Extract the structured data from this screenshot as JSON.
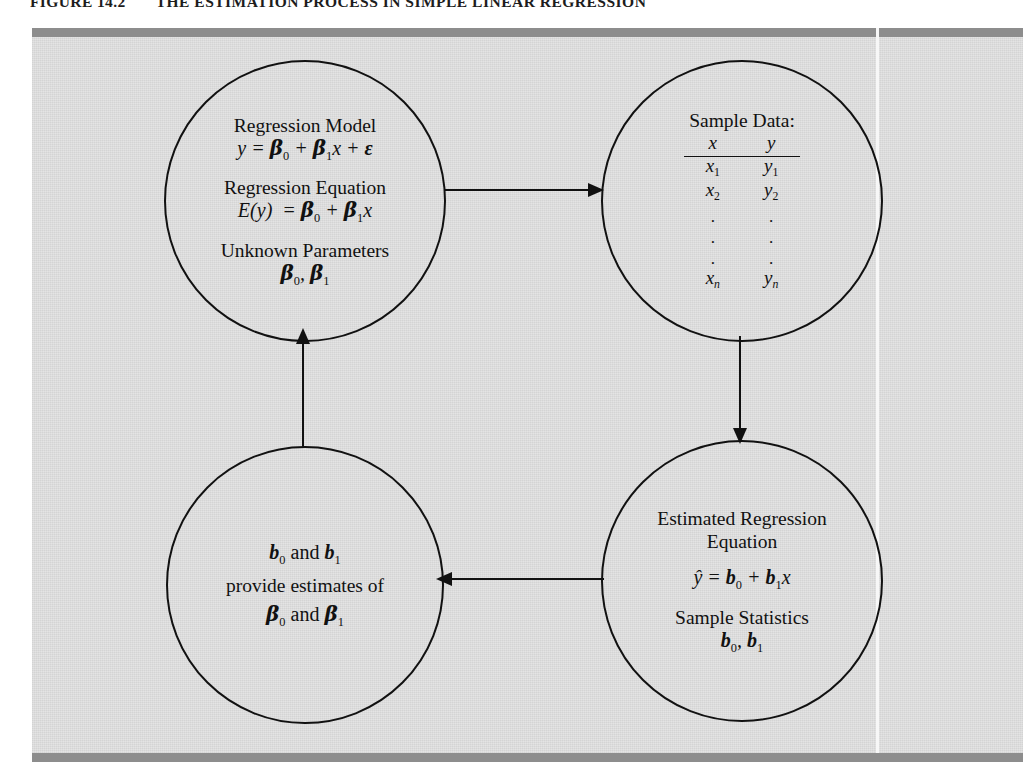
{
  "figure": {
    "label": "FIGURE 14.2",
    "title": "THE ESTIMATION PROCESS IN SIMPLE LINEAR REGRESSION"
  },
  "colors": {
    "plate": "#dcdcdc",
    "bar": "#8d8d8d",
    "ink": "#111111",
    "seam": "#f7f7f7"
  },
  "nodes": {
    "regression_model": {
      "name": "Regression Model",
      "heading1": "Regression Model",
      "equation1": "y = β0 + β1x + ϵ",
      "heading2": "Regression Equation",
      "equation2": "E(y) = β0 + β1x",
      "heading3": "Unknown Parameters",
      "equation3": "β0, β1"
    },
    "sample_data": {
      "name": "Sample Data",
      "heading": "Sample Data:",
      "columns": [
        "x",
        "y"
      ],
      "rows": [
        [
          "x1",
          "y1"
        ],
        [
          "x2",
          "y2"
        ],
        [
          ".",
          "."
        ],
        [
          ".",
          "."
        ],
        [
          ".",
          "."
        ],
        [
          "xn",
          "yn"
        ]
      ]
    },
    "estimated_regression": {
      "name": "Estimated Regression Equation",
      "heading1_line1": "Estimated Regression",
      "heading1_line2": "Equation",
      "equation1": "ŷ = b0 + b1x",
      "heading2": "Sample Statistics",
      "equation2": "b0, b1"
    },
    "estimates": {
      "name": "b0 and b1 provide estimates of β0 and β1",
      "line1": "b0 and b1",
      "line2": "provide estimates of",
      "line3": "β0 and β1"
    }
  },
  "arrows": [
    {
      "id": "model-to-data",
      "from": "regression_model",
      "to": "sample_data",
      "direction": "right"
    },
    {
      "id": "data-to-estimated",
      "from": "sample_data",
      "to": "estimated_regression",
      "direction": "down"
    },
    {
      "id": "estimated-to-estimates",
      "from": "estimated_regression",
      "to": "estimates",
      "direction": "left"
    },
    {
      "id": "estimates-to-model",
      "from": "estimates",
      "to": "regression_model",
      "direction": "up"
    }
  ]
}
